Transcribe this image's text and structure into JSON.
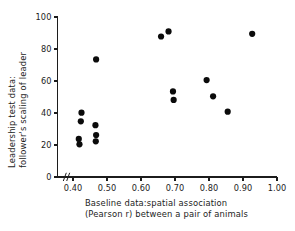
{
  "chart_data": {
    "type": "scatter",
    "title": "",
    "subtitle": "",
    "xlabel_line1": "Baseline data:spatial association",
    "xlabel_line2": "(Pearson r) between a pair of animals",
    "ylabel_line1": "Leadership test data:",
    "ylabel_line2": "follower's scaling of leader",
    "xlim": [
      0.355,
      1.0
    ],
    "ylim": [
      0,
      100
    ],
    "x_ticks": [
      0.4,
      0.5,
      0.6,
      0.7,
      0.8,
      0.9,
      1.0
    ],
    "x_tick_labels": [
      "0.40",
      "0.50",
      "0.60",
      "0.70",
      "0.80",
      "0.90",
      "1.00"
    ],
    "y_ticks": [
      0,
      20,
      40,
      60,
      80,
      100
    ],
    "y_tick_labels": [
      "0",
      "20",
      "40",
      "60",
      "80",
      "100"
    ],
    "grid": false,
    "legend": "none",
    "axis_break": {
      "present": true,
      "axis": "x",
      "symbol": "//",
      "position": 0.375
    },
    "marker": {
      "shape": "circle",
      "color": "#0b0b0b",
      "radius_px": 3.1
    },
    "points": [
      {
        "x": 0.425,
        "y": 40.2
      },
      {
        "x": 0.423,
        "y": 34.8
      },
      {
        "x": 0.417,
        "y": 23.8
      },
      {
        "x": 0.419,
        "y": 20.4
      },
      {
        "x": 0.466,
        "y": 32.4
      },
      {
        "x": 0.468,
        "y": 26.2
      },
      {
        "x": 0.467,
        "y": 22.3
      },
      {
        "x": 0.468,
        "y": 73.5
      },
      {
        "x": 0.659,
        "y": 87.8
      },
      {
        "x": 0.681,
        "y": 91.0
      },
      {
        "x": 0.694,
        "y": 53.5
      },
      {
        "x": 0.696,
        "y": 48.2
      },
      {
        "x": 0.793,
        "y": 60.6
      },
      {
        "x": 0.812,
        "y": 50.4
      },
      {
        "x": 0.855,
        "y": 40.8
      },
      {
        "x": 0.927,
        "y": 89.5
      }
    ]
  }
}
